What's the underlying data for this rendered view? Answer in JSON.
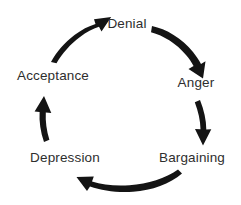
{
  "diagram": {
    "type": "cycle",
    "direction": "clockwise",
    "background_color": "#ffffff",
    "arrow_color": "#141414",
    "label_color": "#2e2e2e",
    "stages": [
      {
        "id": "denial",
        "label": "Denial",
        "position": "top",
        "x": 127,
        "y": 24,
        "order": 1
      },
      {
        "id": "anger",
        "label": "Anger",
        "position": "right",
        "x": 196,
        "y": 83,
        "order": 2
      },
      {
        "id": "bargaining",
        "label": "Bargaining",
        "position": "bottom-right",
        "x": 192,
        "y": 158,
        "order": 3
      },
      {
        "id": "depression",
        "label": "Depression",
        "position": "bottom-left",
        "x": 65,
        "y": 158,
        "order": 4
      },
      {
        "id": "acceptance",
        "label": "Acceptance",
        "position": "left",
        "x": 53,
        "y": 76,
        "order": 5
      }
    ],
    "arrows": [
      {
        "id": "denial-to-anger",
        "from": "denial",
        "to": "anger",
        "name": "arrow-denial-to-anger"
      },
      {
        "id": "anger-to-bargaining",
        "from": "anger",
        "to": "bargaining",
        "name": "arrow-anger-to-bargaining"
      },
      {
        "id": "bargaining-to-depression",
        "from": "bargaining",
        "to": "depression",
        "name": "arrow-bargaining-to-depression"
      },
      {
        "id": "depression-to-acceptance",
        "from": "depression",
        "to": "acceptance",
        "name": "arrow-depression-to-acceptance"
      },
      {
        "id": "acceptance-to-denial",
        "from": "acceptance",
        "to": "denial",
        "name": "arrow-acceptance-to-denial"
      }
    ]
  }
}
